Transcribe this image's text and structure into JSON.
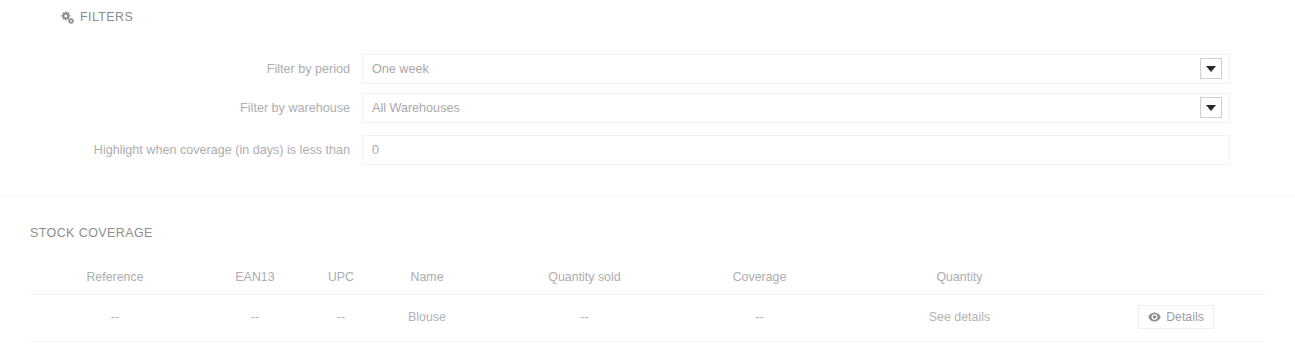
{
  "filters": {
    "heading": "FILTERS",
    "heading_icon": "cogs-icon",
    "fields": [
      {
        "label": "Filter by period",
        "value": "One week",
        "control": "select",
        "caret_icon": "chevron-down-icon"
      },
      {
        "label": "Filter by warehouse",
        "value": "All Warehouses",
        "control": "select",
        "caret_icon": "chevron-down-icon"
      },
      {
        "label": "Highlight when coverage (in days) is less than",
        "value": "0",
        "control": "text"
      }
    ]
  },
  "stock": {
    "heading": "STOCK COVERAGE",
    "columns": [
      "Reference",
      "EAN13",
      "UPC",
      "Name",
      "Quantity sold",
      "Coverage",
      "Quantity",
      ""
    ],
    "rows": [
      {
        "reference": "--",
        "ean13": "--",
        "upc": "--",
        "name": "Blouse",
        "quantity_sold": "--",
        "coverage": "--",
        "quantity": "See details",
        "action_label": "Details",
        "action_icon": "eye-icon"
      }
    ]
  },
  "colors": {
    "text_muted": "#aeaeae",
    "border": "#f1f1f1",
    "background": "#ffffff"
  }
}
